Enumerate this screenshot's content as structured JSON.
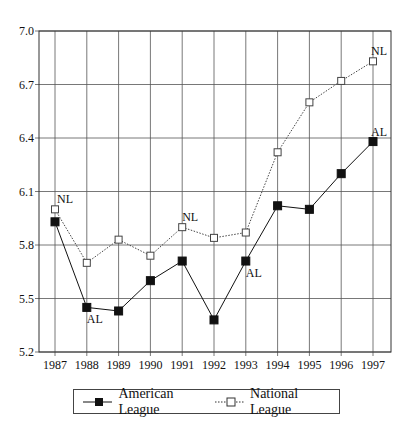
{
  "chart_data": {
    "type": "line",
    "title": "",
    "xlabel": "",
    "ylabel": "",
    "x": [
      "1987",
      "1988",
      "1989",
      "1990",
      "1991",
      "1992",
      "1993",
      "1994",
      "1995",
      "1996",
      "1997"
    ],
    "ylim": [
      5.2,
      7.0
    ],
    "yticks": [
      "5.2",
      "5.5",
      "5.8",
      "6.1",
      "6.4",
      "6.7",
      "7.0"
    ],
    "grid": true,
    "legend_position": "bottom",
    "series": [
      {
        "name": "American League",
        "marker": "filled-square",
        "line": "solid",
        "values": [
          5.93,
          5.45,
          5.43,
          5.6,
          5.71,
          5.38,
          5.71,
          6.02,
          6.0,
          6.2,
          6.38
        ]
      },
      {
        "name": "National League",
        "marker": "open-square",
        "line": "dotted",
        "values": [
          6.0,
          5.7,
          5.83,
          5.74,
          5.9,
          5.84,
          5.87,
          6.32,
          6.6,
          6.72,
          6.83
        ]
      }
    ],
    "annotations": [
      {
        "text": "NL",
        "series": "National League",
        "x": "1987"
      },
      {
        "text": "AL",
        "series": "American League",
        "x": "1988"
      },
      {
        "text": "NL",
        "series": "National League",
        "x": "1991"
      },
      {
        "text": "AL",
        "series": "American League",
        "x": "1993"
      },
      {
        "text": "NL",
        "series": "National League",
        "x": "1997"
      },
      {
        "text": "AL",
        "series": "American League",
        "x": "1997"
      }
    ]
  },
  "legend": {
    "al_label": "American League",
    "nl_label": "National League"
  }
}
